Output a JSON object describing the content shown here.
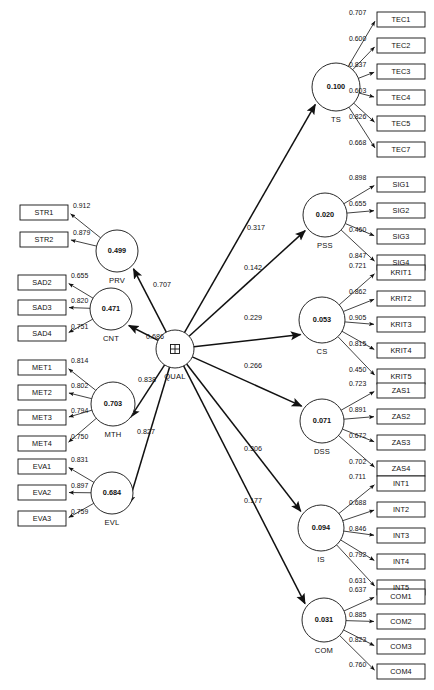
{
  "diagram": {
    "type": "structural-equation-model-path-diagram",
    "title": "",
    "center_construct": {
      "name": "QUAL",
      "symbol": "higher-order-construct-plus-icon",
      "cx": 175,
      "cy": 349,
      "r": 19
    },
    "formative_constructs": [
      {
        "id": "PRV",
        "name": "PRV",
        "value": "0.499",
        "cx": 117,
        "cy": 251,
        "r": 21,
        "path_to_center": "0.707",
        "path_label_x": 153,
        "path_label_y": 285,
        "indicators": [
          {
            "label": "STR1",
            "loading": "0.912",
            "x": 20,
            "y": 205
          },
          {
            "label": "STR2",
            "loading": "0.879",
            "x": 20,
            "y": 232
          }
        ]
      },
      {
        "id": "CNT",
        "name": "CNT",
        "value": "0.471",
        "cx": 111,
        "cy": 309,
        "r": 21,
        "path_to_center": "0.686",
        "path_label_x": 146,
        "path_label_y": 337,
        "indicators": [
          {
            "label": "SAD2",
            "loading": "0.655",
            "x": 18,
            "y": 275
          },
          {
            "label": "SAD3",
            "loading": "0.820",
            "x": 18,
            "y": 300
          },
          {
            "label": "SAD4",
            "loading": "0.751",
            "x": 18,
            "y": 326
          }
        ]
      },
      {
        "id": "MTH",
        "name": "MTH",
        "value": "0.703",
        "cx": 113,
        "cy": 404,
        "r": 22,
        "path_to_center": "0.838",
        "path_label_x": 138,
        "path_label_y": 380,
        "indicators": [
          {
            "label": "MET1",
            "loading": "0.814",
            "x": 18,
            "y": 360
          },
          {
            "label": "MET2",
            "loading": "0.802",
            "x": 18,
            "y": 385
          },
          {
            "label": "MET3",
            "loading": "0.794",
            "x": 18,
            "y": 410
          },
          {
            "label": "MET4",
            "loading": "0.750",
            "x": 18,
            "y": 436
          }
        ]
      },
      {
        "id": "EVL",
        "name": "EVL",
        "value": "0.684",
        "cx": 112,
        "cy": 493,
        "r": 21,
        "path_to_center": "0.827",
        "path_label_x": 137,
        "path_label_y": 432,
        "indicators": [
          {
            "label": "EVA1",
            "loading": "0.831",
            "x": 18,
            "y": 459
          },
          {
            "label": "EVA2",
            "loading": "0.897",
            "x": 18,
            "y": 485
          },
          {
            "label": "EVA3",
            "loading": "0.759",
            "x": 18,
            "y": 511
          }
        ]
      }
    ],
    "outcome_constructs": [
      {
        "id": "TS",
        "name": "TS",
        "value": "0.100",
        "cx": 336,
        "cy": 87,
        "r": 24,
        "path_from_center": "0.317",
        "path_label_x": 247,
        "path_label_y": 228,
        "indicators": [
          {
            "label": "TEC1",
            "loading": "0.707",
            "x": 377,
            "y": 12
          },
          {
            "label": "TEC2",
            "loading": "0.600",
            "x": 377,
            "y": 38
          },
          {
            "label": "TEC3",
            "loading": "0.837",
            "x": 377,
            "y": 64
          },
          {
            "label": "TEC4",
            "loading": "0.603",
            "x": 377,
            "y": 90
          },
          {
            "label": "TEC5",
            "loading": "0.826",
            "x": 377,
            "y": 116
          },
          {
            "label": "TEC7",
            "loading": "0.668",
            "x": 377,
            "y": 142
          }
        ]
      },
      {
        "id": "PSS",
        "name": "PSS",
        "value": "0.020",
        "cx": 325,
        "cy": 215,
        "r": 22,
        "path_from_center": "0.142",
        "path_label_x": 244,
        "path_label_y": 268,
        "indicators": [
          {
            "label": "SIG1",
            "loading": "0.898",
            "x": 377,
            "y": 177
          },
          {
            "label": "SIG2",
            "loading": "0.655",
            "x": 377,
            "y": 203
          },
          {
            "label": "SIG3",
            "loading": "0.460",
            "x": 377,
            "y": 229
          },
          {
            "label": "SIG4",
            "loading": "0.847",
            "x": 377,
            "y": 255
          }
        ]
      },
      {
        "id": "CS",
        "name": "CS",
        "value": "0.053",
        "cx": 322,
        "cy": 320,
        "r": 23,
        "path_from_center": "0.229",
        "path_label_x": 244,
        "path_label_y": 318,
        "indicators": [
          {
            "label": "KRIT1",
            "loading": "0.721",
            "x": 377,
            "y": 265
          },
          {
            "label": "KRIT2",
            "loading": "0.862",
            "x": 377,
            "y": 291
          },
          {
            "label": "KRIT3",
            "loading": "0.905",
            "x": 377,
            "y": 317
          },
          {
            "label": "KRIT4",
            "loading": "0.815",
            "x": 377,
            "y": 343
          },
          {
            "label": "KRIT5",
            "loading": "0.450",
            "x": 377,
            "y": 369
          }
        ]
      },
      {
        "id": "DSS",
        "name": "DSS",
        "value": "0.071",
        "cx": 322,
        "cy": 421,
        "r": 22,
        "path_from_center": "0.266",
        "path_label_x": 244,
        "path_label_y": 366,
        "indicators": [
          {
            "label": "ZAS1",
            "loading": "0.723",
            "x": 377,
            "y": 383
          },
          {
            "label": "ZAS2",
            "loading": "0.891",
            "x": 377,
            "y": 409
          },
          {
            "label": "ZAS3",
            "loading": "0.672",
            "x": 377,
            "y": 435
          },
          {
            "label": "ZAS4",
            "loading": "0.702",
            "x": 377,
            "y": 461
          }
        ]
      },
      {
        "id": "IS",
        "name": "IS",
        "value": "0.094",
        "cx": 321,
        "cy": 528,
        "r": 23,
        "path_from_center": "0.306",
        "path_label_x": 244,
        "path_label_y": 449,
        "indicators": [
          {
            "label": "INT1",
            "loading": "0.711",
            "x": 377,
            "y": 476
          },
          {
            "label": "INT2",
            "loading": "0.688",
            "x": 377,
            "y": 502
          },
          {
            "label": "INT3",
            "loading": "0.846",
            "x": 377,
            "y": 528
          },
          {
            "label": "INT4",
            "loading": "0.792",
            "x": 377,
            "y": 554
          },
          {
            "label": "INT5",
            "loading": "0.631",
            "x": 377,
            "y": 580
          }
        ]
      },
      {
        "id": "COM",
        "name": "COM",
        "value": "0.031",
        "cx": 324,
        "cy": 620,
        "r": 22,
        "path_from_center": "0.177",
        "path_label_x": 244,
        "path_label_y": 501,
        "indicators": [
          {
            "label": "COM1",
            "loading": "0.637",
            "x": 377,
            "y": 589
          },
          {
            "label": "COM2",
            "loading": "0.885",
            "x": 377,
            "y": 614
          },
          {
            "label": "COM3",
            "loading": "0.823",
            "x": 377,
            "y": 639
          },
          {
            "label": "COM4",
            "loading": "0.760",
            "x": 377,
            "y": 664
          }
        ]
      }
    ],
    "style": {
      "stroke_color": "#111111",
      "fill_color": "#ffffff",
      "background": "#ffffff"
    }
  }
}
